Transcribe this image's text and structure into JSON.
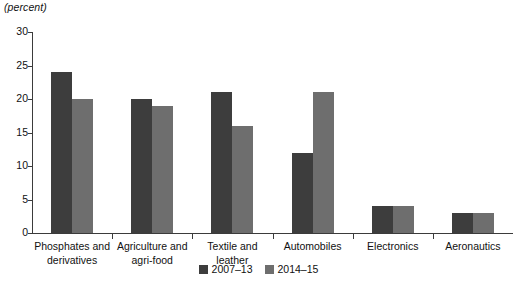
{
  "chart_data": {
    "type": "bar",
    "title": "",
    "subtitle": "",
    "unit_label": "(percent)",
    "xlabel": "",
    "ylabel": "",
    "ylim": [
      0,
      30
    ],
    "yticks": [
      0,
      5,
      10,
      15,
      20,
      25,
      30
    ],
    "ytick_labels": [
      "0",
      "5",
      "10",
      "15",
      "20",
      "25",
      "30"
    ],
    "grid": false,
    "legend_position": "bottom-center",
    "categories": [
      "Phosphates and\nderivatives",
      "Agriculture and\nagri-food",
      "Textile and\nleather",
      "Automobiles",
      "Electronics",
      "Aeronautics"
    ],
    "series": [
      {
        "name": "2007–13",
        "color": "#3d3d3d",
        "values": [
          24,
          20,
          21,
          12,
          4,
          3
        ]
      },
      {
        "name": "2014–15",
        "color": "#6e6e6e",
        "values": [
          20,
          19,
          16,
          21,
          4,
          3
        ]
      }
    ]
  },
  "colors": {
    "axis": "#3b3b3b",
    "text": "#111111",
    "background": "#ffffff",
    "series_2007_13": "#3d3d3d",
    "series_2014_15": "#6e6e6e"
  }
}
